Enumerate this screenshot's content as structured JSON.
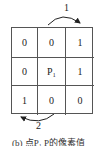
{
  "diagram": {
    "grid": [
      [
        "0",
        "0",
        "1"
      ],
      [
        "0",
        "P₁",
        "1"
      ],
      [
        "1",
        "0",
        "0"
      ]
    ],
    "arrow_top_label": "1",
    "arrow_bottom_label": "2",
    "caption": "(b) 点P₁ P的像素值"
  }
}
